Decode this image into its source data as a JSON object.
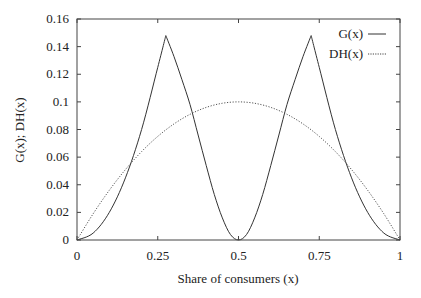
{
  "chart_data": {
    "type": "line",
    "title": "",
    "xlabel": "Share of consumers (x)",
    "ylabel": "G(x); DH(x)",
    "xlim": [
      0,
      1
    ],
    "ylim": [
      0,
      0.16
    ],
    "x_ticks": [
      0,
      0.25,
      0.5,
      0.75,
      1
    ],
    "x_tick_labels": [
      "0",
      "0.25",
      "0.5",
      "0.75",
      "1"
    ],
    "y_ticks": [
      0,
      0.02,
      0.04,
      0.06,
      0.08,
      0.1,
      0.12,
      0.14,
      0.16
    ],
    "y_tick_labels": [
      "0",
      "0.02",
      "0.04",
      "0.06",
      "0.08",
      "0.1",
      "0.12",
      "0.14",
      "0.16"
    ],
    "grid": false,
    "legend_position": "top-right",
    "series": [
      {
        "name": "G(x)",
        "style": "solid",
        "x": [
          0,
          0.05,
          0.1,
          0.15,
          0.2,
          0.25,
          0.275,
          0.3,
          0.325,
          0.35,
          0.375,
          0.4,
          0.425,
          0.45,
          0.475,
          0.5,
          0.525,
          0.55,
          0.575,
          0.6,
          0.625,
          0.65,
          0.675,
          0.7,
          0.725,
          0.75,
          0.8,
          0.85,
          0.9,
          0.95,
          1
        ],
        "values": [
          0,
          0.005,
          0.02,
          0.045,
          0.08,
          0.125,
          0.148,
          0.133,
          0.116,
          0.098,
          0.076,
          0.054,
          0.033,
          0.016,
          0.004,
          0,
          0.004,
          0.016,
          0.033,
          0.054,
          0.076,
          0.098,
          0.116,
          0.133,
          0.148,
          0.125,
          0.08,
          0.045,
          0.02,
          0.005,
          0
        ]
      },
      {
        "name": "DH(x)",
        "style": "dotted",
        "x": [
          0,
          0.05,
          0.1,
          0.15,
          0.2,
          0.25,
          0.3,
          0.35,
          0.4,
          0.45,
          0.5,
          0.55,
          0.6,
          0.65,
          0.7,
          0.75,
          0.8,
          0.85,
          0.9,
          0.95,
          1
        ],
        "values": [
          0,
          0.019,
          0.036,
          0.051,
          0.064,
          0.075,
          0.084,
          0.091,
          0.096,
          0.099,
          0.1,
          0.099,
          0.096,
          0.091,
          0.084,
          0.075,
          0.064,
          0.051,
          0.036,
          0.019,
          0
        ]
      }
    ]
  }
}
